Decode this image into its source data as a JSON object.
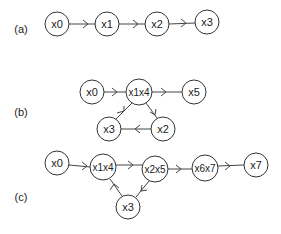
{
  "diagram": {
    "panels": [
      {
        "label": "(a)",
        "nodes": [
          {
            "id": "x0",
            "label": "x0"
          },
          {
            "id": "x1",
            "label": "x1"
          },
          {
            "id": "x2",
            "label": "x2"
          },
          {
            "id": "x3",
            "label": "x3"
          }
        ],
        "edges": [
          {
            "from": "x0",
            "to": "x1"
          },
          {
            "from": "x1",
            "to": "x2"
          },
          {
            "from": "x2",
            "to": "x3"
          }
        ]
      },
      {
        "label": "(b)",
        "nodes": [
          {
            "id": "x0",
            "label": "x0"
          },
          {
            "id": "x1x4",
            "label": "x1x4"
          },
          {
            "id": "x5",
            "label": "x5"
          },
          {
            "id": "x2",
            "label": "x2"
          },
          {
            "id": "x3",
            "label": "x3"
          }
        ],
        "edges": [
          {
            "from": "x0",
            "to": "x1x4"
          },
          {
            "from": "x1x4",
            "to": "x5"
          },
          {
            "from": "x1x4",
            "to": "x2"
          },
          {
            "from": "x2",
            "to": "x3"
          },
          {
            "from": "x3",
            "to": "x1x4"
          }
        ]
      },
      {
        "label": "(c)",
        "nodes": [
          {
            "id": "x0",
            "label": "x0"
          },
          {
            "id": "x1x4",
            "label": "x1x4"
          },
          {
            "id": "x2x5",
            "label": "x2x5"
          },
          {
            "id": "x6x7",
            "label": "x6x7"
          },
          {
            "id": "x7",
            "label": "x7"
          },
          {
            "id": "x3",
            "label": "x3"
          }
        ],
        "edges": [
          {
            "from": "x0",
            "to": "x1x4"
          },
          {
            "from": "x1x4",
            "to": "x2x5"
          },
          {
            "from": "x2x5",
            "to": "x6x7"
          },
          {
            "from": "x6x7",
            "to": "x7"
          },
          {
            "from": "x2x5",
            "to": "x3"
          },
          {
            "from": "x3",
            "to": "x1x4"
          }
        ]
      }
    ]
  }
}
